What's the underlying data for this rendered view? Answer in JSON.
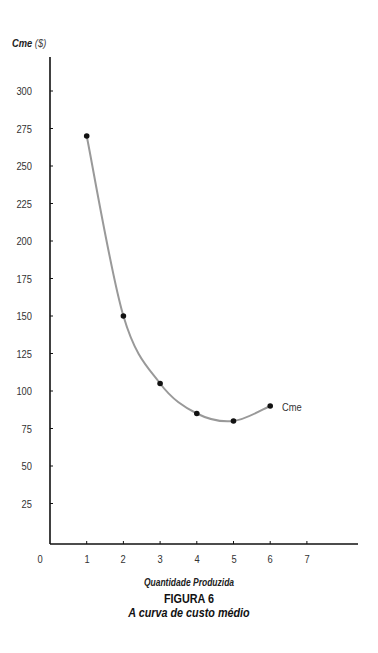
{
  "chart_data": {
    "type": "line",
    "title": "A curva de custo médio",
    "figure_label": "FIGURA 6",
    "xlabel": "Quantidade Produzida",
    "ylabel": "Cme",
    "ylabel_unit": "($)",
    "x": [
      1,
      2,
      3,
      4,
      5,
      6
    ],
    "series": [
      {
        "name": "Cme",
        "values": [
          270,
          150,
          105,
          85,
          80,
          90
        ],
        "color": "#999999",
        "marker_color": "#111111",
        "smooth": true
      }
    ],
    "xlim": [
      0,
      8
    ],
    "ylim": [
      0,
      325
    ],
    "x_ticks": [
      "0",
      "1",
      "2",
      "3",
      "4",
      "5",
      "6",
      "7"
    ],
    "y_ticks": [
      "25",
      "50",
      "75",
      "100",
      "125",
      "150",
      "175",
      "200",
      "225",
      "250",
      "275",
      "300"
    ],
    "grid": false,
    "legend": "inline label at end of curve"
  },
  "labels": {
    "ylabel_main": "Cme",
    "ylabel_unit": "($)",
    "xlabel": "Quantidade Produzida",
    "figure_num": "FIGURA 6",
    "figure_title": "A curva de custo médio",
    "series_label": "Cme"
  }
}
